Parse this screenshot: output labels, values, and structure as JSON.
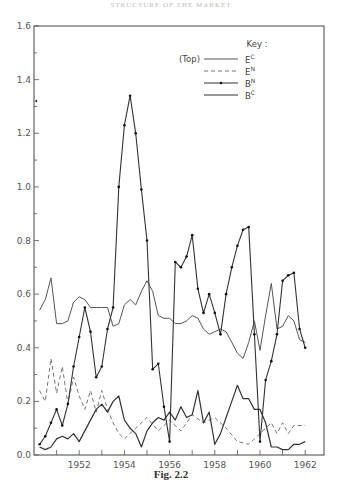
{
  "header": {
    "running_head": "STRUCTURE OF THE MARKET"
  },
  "caption": "Fig. 2.2",
  "legend": {
    "title": "Key :",
    "top_note": "(Top)",
    "entries": [
      {
        "label": "E",
        "sup": "C",
        "style": "solid"
      },
      {
        "label": "E",
        "sup": "N",
        "style": "dashed"
      },
      {
        "label": "B",
        "sup": "N",
        "style": "dot-dash"
      },
      {
        "label": "B",
        "sup": "C",
        "style": "solid-heavy"
      }
    ]
  },
  "axes": {
    "y_ticks": [
      "0.0",
      "0.2",
      "0.4",
      "0.6",
      "0.8",
      "1.0",
      "1.2",
      "1.4",
      "1.6"
    ],
    "x_ticks": [
      "1952",
      "1954",
      "1956",
      "1958",
      "1960",
      "1962"
    ]
  },
  "chart_data": {
    "type": "line",
    "title": "",
    "caption": "Fig. 2.2",
    "xlabel": "",
    "ylabel": "",
    "xlim": [
      1950,
      1962.8
    ],
    "ylim": [
      0.0,
      1.6
    ],
    "grid": false,
    "legend_position": "top-right (inside plot)",
    "legend_title": "Key :",
    "x_tick_labels": [
      1952,
      1954,
      1956,
      1958,
      1960,
      1962
    ],
    "y_tick_labels": [
      0.0,
      0.2,
      0.4,
      0.6,
      0.8,
      1.0,
      1.2,
      1.4,
      1.6
    ],
    "annotations": [
      {
        "text": "stray point",
        "x": 1950.1,
        "y": 1.32
      }
    ],
    "series": [
      {
        "name": "E^C",
        "style": "solid",
        "points": [
          [
            1950.25,
            0.54
          ],
          [
            1950.5,
            0.58
          ],
          [
            1950.75,
            0.66
          ],
          [
            1951.0,
            0.49
          ],
          [
            1951.25,
            0.49
          ],
          [
            1951.5,
            0.5
          ],
          [
            1951.75,
            0.57
          ],
          [
            1952.0,
            0.59
          ],
          [
            1952.25,
            0.58
          ],
          [
            1952.5,
            0.55
          ],
          [
            1952.75,
            0.55
          ],
          [
            1953.0,
            0.55
          ],
          [
            1953.25,
            0.55
          ],
          [
            1953.5,
            0.48
          ],
          [
            1953.75,
            0.49
          ],
          [
            1954.0,
            0.56
          ],
          [
            1954.25,
            0.58
          ],
          [
            1954.5,
            0.56
          ],
          [
            1954.75,
            0.61
          ],
          [
            1955.0,
            0.65
          ],
          [
            1955.25,
            0.61
          ],
          [
            1955.5,
            0.52
          ],
          [
            1955.75,
            0.51
          ],
          [
            1956.0,
            0.51
          ],
          [
            1956.25,
            0.49
          ],
          [
            1956.5,
            0.49
          ],
          [
            1956.75,
            0.5
          ],
          [
            1957.0,
            0.52
          ],
          [
            1957.25,
            0.51
          ],
          [
            1957.5,
            0.47
          ],
          [
            1957.75,
            0.45
          ],
          [
            1958.0,
            0.46
          ],
          [
            1958.25,
            0.47
          ],
          [
            1958.5,
            0.46
          ],
          [
            1958.75,
            0.42
          ],
          [
            1959.0,
            0.38
          ],
          [
            1959.25,
            0.36
          ],
          [
            1959.5,
            0.42
          ],
          [
            1959.75,
            0.5
          ],
          [
            1960.0,
            0.39
          ],
          [
            1960.25,
            0.52
          ],
          [
            1960.5,
            0.64
          ],
          [
            1960.75,
            0.47
          ],
          [
            1961.0,
            0.48
          ],
          [
            1961.25,
            0.52
          ],
          [
            1961.5,
            0.5
          ],
          [
            1961.75,
            0.43
          ],
          [
            1962.0,
            0.42
          ]
        ]
      },
      {
        "name": "E^N",
        "style": "dashed",
        "points": [
          [
            1950.25,
            0.24
          ],
          [
            1950.5,
            0.2
          ],
          [
            1950.75,
            0.36
          ],
          [
            1951.0,
            0.23
          ],
          [
            1951.25,
            0.33
          ],
          [
            1951.5,
            0.19
          ],
          [
            1951.75,
            0.29
          ],
          [
            1952.0,
            0.22
          ],
          [
            1952.25,
            0.17
          ],
          [
            1952.5,
            0.24
          ],
          [
            1952.75,
            0.16
          ],
          [
            1953.0,
            0.24
          ],
          [
            1953.25,
            0.17
          ],
          [
            1953.5,
            0.12
          ],
          [
            1953.75,
            0.08
          ],
          [
            1954.0,
            0.06
          ],
          [
            1954.5,
            0.1
          ],
          [
            1955.0,
            0.14
          ],
          [
            1955.5,
            0.09
          ],
          [
            1956.0,
            0.13
          ],
          [
            1956.5,
            0.09
          ],
          [
            1957.0,
            0.15
          ],
          [
            1957.5,
            0.12
          ],
          [
            1958.0,
            0.14
          ],
          [
            1958.5,
            0.1
          ],
          [
            1959.0,
            0.05
          ],
          [
            1959.5,
            0.04
          ],
          [
            1960.0,
            0.08
          ],
          [
            1960.5,
            0.12
          ],
          [
            1960.75,
            0.08
          ],
          [
            1961.0,
            0.12
          ],
          [
            1961.25,
            0.08
          ],
          [
            1961.5,
            0.11
          ],
          [
            1962.0,
            0.11
          ]
        ]
      },
      {
        "name": "B^N",
        "style": "dot-dash",
        "points": [
          [
            1950.25,
            0.04
          ],
          [
            1950.5,
            0.07
          ],
          [
            1950.75,
            0.12
          ],
          [
            1951.0,
            0.17
          ],
          [
            1951.25,
            0.11
          ],
          [
            1951.5,
            0.19
          ],
          [
            1951.75,
            0.33
          ],
          [
            1952.0,
            0.44
          ],
          [
            1952.25,
            0.55
          ],
          [
            1952.5,
            0.46
          ],
          [
            1952.75,
            0.29
          ],
          [
            1953.0,
            0.33
          ],
          [
            1953.25,
            0.47
          ],
          [
            1953.5,
            0.55
          ],
          [
            1953.75,
            1.0
          ],
          [
            1954.0,
            1.23
          ],
          [
            1954.25,
            1.34
          ],
          [
            1954.5,
            1.2
          ],
          [
            1954.75,
            0.99
          ],
          [
            1955.0,
            0.8
          ],
          [
            1955.25,
            0.32
          ],
          [
            1955.5,
            0.34
          ],
          [
            1955.75,
            0.18
          ],
          [
            1956.0,
            0.05
          ],
          [
            1956.25,
            0.72
          ],
          [
            1956.5,
            0.7
          ],
          [
            1956.75,
            0.74
          ],
          [
            1957.0,
            0.82
          ],
          [
            1957.25,
            0.62
          ],
          [
            1957.5,
            0.53
          ],
          [
            1957.75,
            0.6
          ],
          [
            1958.0,
            0.53
          ],
          [
            1958.25,
            0.45
          ],
          [
            1958.5,
            0.6
          ],
          [
            1958.75,
            0.7
          ],
          [
            1959.0,
            0.78
          ],
          [
            1959.25,
            0.84
          ],
          [
            1959.5,
            0.85
          ],
          [
            1959.75,
            0.45
          ],
          [
            1960.0,
            0.05
          ],
          [
            1960.25,
            0.28
          ],
          [
            1960.5,
            0.35
          ],
          [
            1960.75,
            0.45
          ],
          [
            1961.0,
            0.65
          ],
          [
            1961.25,
            0.67
          ],
          [
            1961.5,
            0.68
          ],
          [
            1961.75,
            0.47
          ],
          [
            1962.0,
            0.4
          ]
        ]
      },
      {
        "name": "B^C",
        "style": "solid-heavy",
        "points": [
          [
            1950.25,
            0.03
          ],
          [
            1950.5,
            0.02
          ],
          [
            1950.75,
            0.03
          ],
          [
            1951.0,
            0.06
          ],
          [
            1951.25,
            0.07
          ],
          [
            1951.5,
            0.06
          ],
          [
            1951.75,
            0.08
          ],
          [
            1952.0,
            0.05
          ],
          [
            1952.25,
            0.09
          ],
          [
            1952.5,
            0.13
          ],
          [
            1952.75,
            0.17
          ],
          [
            1953.0,
            0.19
          ],
          [
            1953.25,
            0.16
          ],
          [
            1953.5,
            0.2
          ],
          [
            1953.75,
            0.22
          ],
          [
            1954.0,
            0.13
          ],
          [
            1954.25,
            0.1
          ],
          [
            1954.5,
            0.08
          ],
          [
            1954.75,
            0.03
          ],
          [
            1955.0,
            0.09
          ],
          [
            1955.25,
            0.12
          ],
          [
            1955.5,
            0.14
          ],
          [
            1955.75,
            0.13
          ],
          [
            1956.0,
            0.16
          ],
          [
            1956.25,
            0.13
          ],
          [
            1956.5,
            0.18
          ],
          [
            1956.75,
            0.14
          ],
          [
            1957.0,
            0.15
          ],
          [
            1957.25,
            0.24
          ],
          [
            1957.5,
            0.12
          ],
          [
            1957.75,
            0.16
          ],
          [
            1958.0,
            0.04
          ],
          [
            1958.25,
            0.08
          ],
          [
            1958.5,
            0.14
          ],
          [
            1958.75,
            0.2
          ],
          [
            1959.0,
            0.26
          ],
          [
            1959.25,
            0.21
          ],
          [
            1959.5,
            0.21
          ],
          [
            1959.75,
            0.17
          ],
          [
            1960.0,
            0.17
          ],
          [
            1960.25,
            0.12
          ],
          [
            1960.5,
            0.03
          ],
          [
            1960.75,
            0.03
          ],
          [
            1961.0,
            0.02
          ],
          [
            1961.25,
            0.02
          ],
          [
            1961.5,
            0.04
          ],
          [
            1961.75,
            0.04
          ],
          [
            1962.0,
            0.05
          ]
        ]
      }
    ]
  }
}
